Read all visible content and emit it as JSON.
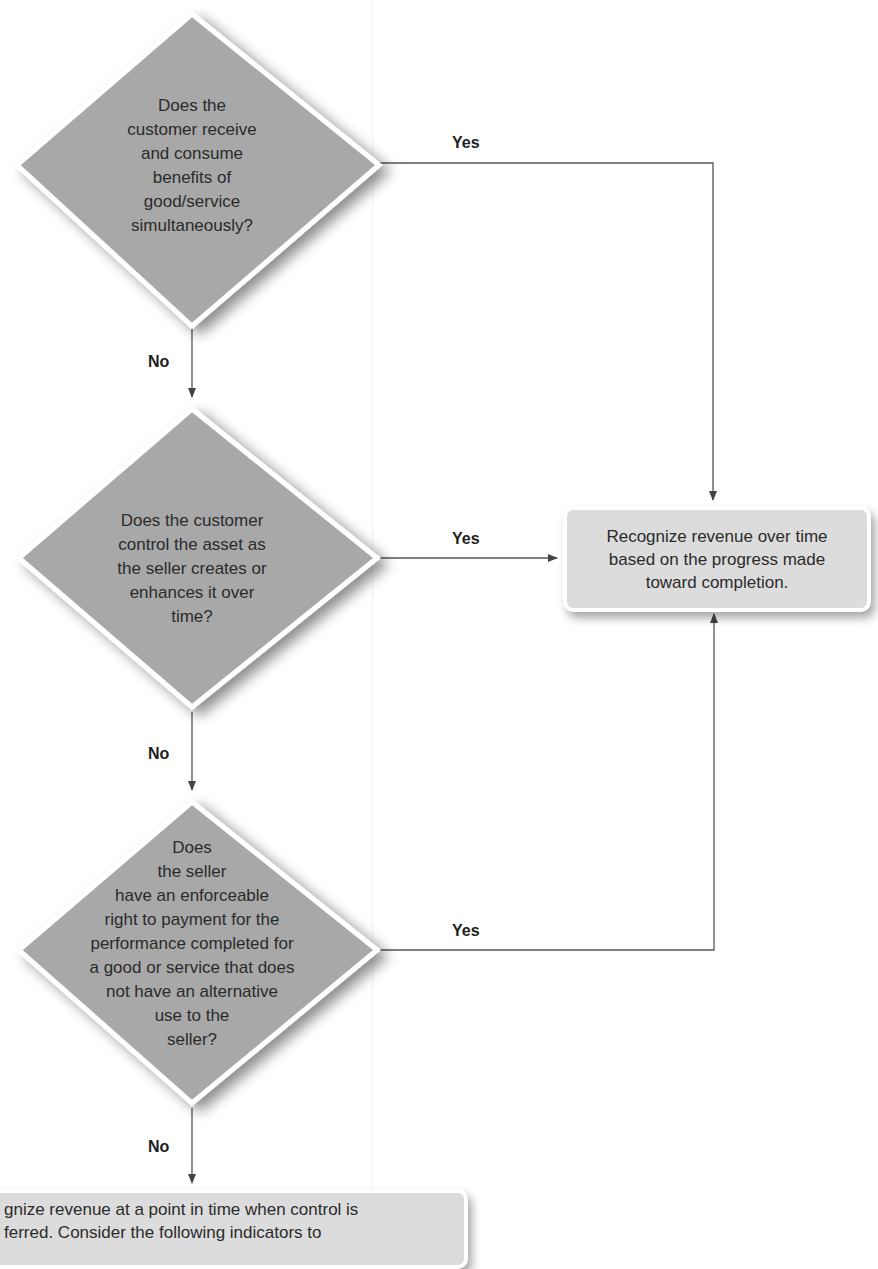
{
  "flowchart": {
    "questions": [
      {
        "id": "q1",
        "text": "Does the customer receive and consume benefits of good/service simultaneously?",
        "lines": [
          "Does the",
          "customer receive",
          "and consume",
          "benefits of",
          "good/service",
          "simultaneously?"
        ]
      },
      {
        "id": "q2",
        "text": "Does the customer control the asset as the seller creates or enhances it over time?",
        "lines": [
          "Does the customer",
          "control the asset as",
          "the seller creates or",
          "enhances it over",
          "time?"
        ]
      },
      {
        "id": "q3",
        "text": "Does the seller have an enforceable right to payment for the performance completed for a good or service that does not have an alternative use to the seller?",
        "lines": [
          "Does",
          "the seller",
          "have an enforceable",
          "right to payment for the",
          "performance completed for",
          "a good or service that does",
          "not have an alternative",
          "use to the",
          "seller?"
        ]
      }
    ],
    "branch_labels": {
      "yes": "Yes",
      "no": "No"
    },
    "over_time_result": {
      "lines": [
        "Recognize revenue over time",
        "based on the progress made",
        "toward completion."
      ]
    },
    "point_in_time_result": {
      "lines": [
        "gnize revenue at a point in time when control is",
        "ferred. Consider the following indicators to"
      ]
    },
    "colors": {
      "diamond_fill": "#a8a8a8",
      "box_fill": "#dcdcdc",
      "line": "#555555"
    }
  }
}
